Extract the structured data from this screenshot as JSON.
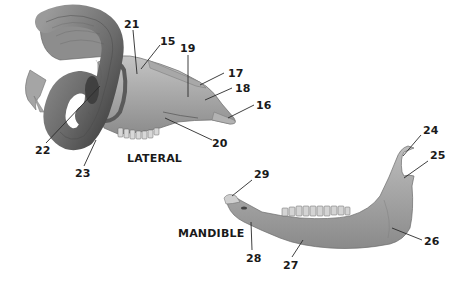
{
  "figure": {
    "views": {
      "lateral": "LATERAL",
      "mandible": "MANDIBLE"
    },
    "skull_labels": [
      {
        "id": "15",
        "x": 160,
        "y": 36
      },
      {
        "id": "16",
        "x": 256,
        "y": 100
      },
      {
        "id": "17",
        "x": 228,
        "y": 68
      },
      {
        "id": "18",
        "x": 235,
        "y": 83
      },
      {
        "id": "19",
        "x": 180,
        "y": 43
      },
      {
        "id": "20",
        "x": 124,
        "y": 19
      },
      {
        "id": "21",
        "x": 212,
        "y": 138
      },
      {
        "id": "22",
        "x": 35,
        "y": 145
      },
      {
        "id": "23",
        "x": 75,
        "y": 168
      }
    ],
    "mandible_labels": [
      {
        "id": "24",
        "x": 423,
        "y": 125
      },
      {
        "id": "25",
        "x": 430,
        "y": 150
      },
      {
        "id": "26",
        "x": 424,
        "y": 236
      },
      {
        "id": "27",
        "x": 283,
        "y": 260
      },
      {
        "id": "28",
        "x": 246,
        "y": 253
      },
      {
        "id": "29",
        "x": 254,
        "y": 173
      }
    ],
    "colors": {
      "bone_light": "#b5b5b5",
      "bone_mid": "#8f8f8f",
      "bone_dark": "#5a5a5a",
      "horn": "#6e6e6e",
      "leader_line": "#2a2a2a",
      "text": "#1a1a1a"
    }
  }
}
